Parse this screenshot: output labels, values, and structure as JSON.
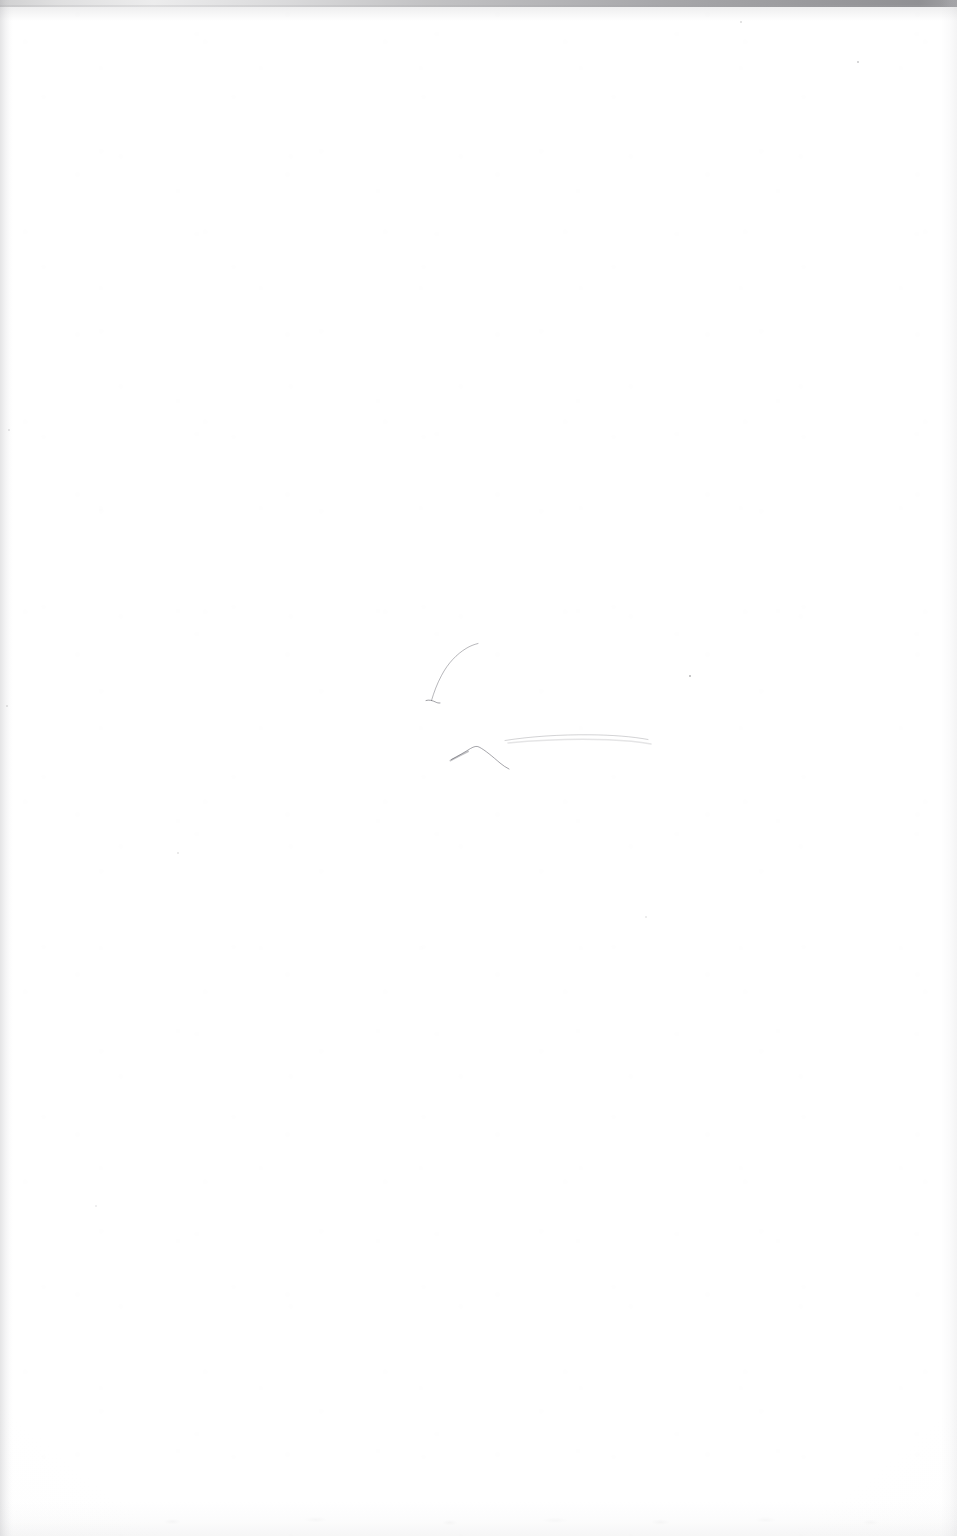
{
  "document": {
    "type": "scanned-page",
    "kind": "blank-flyleaf",
    "page_width": 957,
    "page_height": 1536,
    "visible_text": "",
    "text_blocks": [],
    "background_color": "#fefefe",
    "paper_tone": "#fdfdfd"
  },
  "scan_artifacts": {
    "top_edge_band": {
      "label": "scanner top edge shadow",
      "color_left": "#96969a",
      "color_right": "#787880",
      "height_px": 7
    },
    "left_edge_band": {
      "label": "scanner left edge shadow",
      "color": "#a8a8ac",
      "width_px": 13
    },
    "right_edge_band": {
      "label": "scanner right edge shadow",
      "color": "#babac0",
      "width_px": 16
    },
    "bottom_edge_band": {
      "label": "scanner bottom edge mottling",
      "color": "#c4c4c7",
      "height_px": 34
    },
    "specks": [
      {
        "name": "speck-top-center",
        "x": 741,
        "y": 22,
        "size": 1.5,
        "opacity": 0.28
      },
      {
        "name": "speck-top-right",
        "x": 858,
        "y": 62,
        "size": 2.0,
        "opacity": 0.45
      },
      {
        "name": "speck-center-right",
        "x": 690,
        "y": 676,
        "size": 2.4,
        "opacity": 0.62
      },
      {
        "name": "speck-left-mid",
        "x": 178,
        "y": 853,
        "size": 1.6,
        "opacity": 0.22
      },
      {
        "name": "speck-lower-right",
        "x": 646,
        "y": 917,
        "size": 1.4,
        "opacity": 0.18
      },
      {
        "name": "speck-lower-left",
        "x": 96,
        "y": 1206,
        "size": 1.4,
        "opacity": 0.16
      },
      {
        "name": "speck-edge-left-upper",
        "x": 9,
        "y": 430,
        "size": 1.8,
        "opacity": 0.24
      },
      {
        "name": "speck-edge-left-lower",
        "x": 7,
        "y": 706,
        "size": 1.8,
        "opacity": 0.26
      }
    ]
  },
  "pencil_marks": {
    "label": "faint handwritten pencil strokes",
    "stroke_color": "#5b5b64",
    "strokes": [
      {
        "name": "diagonal-ascender-stroke",
        "description": "thin diagonal pencil stroke rising to the upper right",
        "path": "M 431.5 700.5 C 434 692 437 684 441.5 675.5 C 448 663 457 654 466 648.5 C 470 646 474 644.5 478 643.5",
        "width": 0.85,
        "opacity": 0.52
      },
      {
        "name": "diagonal-stroke-tail-hook",
        "description": "small hook at the base of the diagonal stroke",
        "path": "M 426 700.5 C 429 699.5 432.5 700.5 435.5 702 C 437 702.8 438.5 703.2 440 703",
        "width": 1.0,
        "opacity": 0.58
      },
      {
        "name": "caret-peak-stroke",
        "description": "inverted-V caret shaped pencil mark",
        "path": "M 451.5 759.5 C 458 756 465 752 470.5 748.5 C 474 746.5 476.5 745.8 479 747 C 485 750 493 757 500 763 C 503 765.5 506 767.5 509 769",
        "width": 1.0,
        "opacity": 0.55
      },
      {
        "name": "caret-left-tail",
        "description": "short thick tail on the left of the caret",
        "path": "M 450.5 760.5 C 456 757.5 462 754.5 468 751.5",
        "width": 1.9,
        "opacity": 0.38
      },
      {
        "name": "long-horizontal-stroke",
        "description": "long faint nearly horizontal pencil stroke",
        "path": "M 505 740.5 C 530 736.5 560 734.5 590 734.8 C 612 735 632 736.5 648 739.5",
        "width": 0.9,
        "opacity": 0.3
      },
      {
        "name": "long-horizontal-stroke-fade",
        "description": "faint lower echo of the long horizontal stroke",
        "path": "M 508 743 C 540 740 575 738.5 608 739.8 C 626 740.5 640 742 651 744",
        "width": 1.4,
        "opacity": 0.16
      }
    ]
  }
}
